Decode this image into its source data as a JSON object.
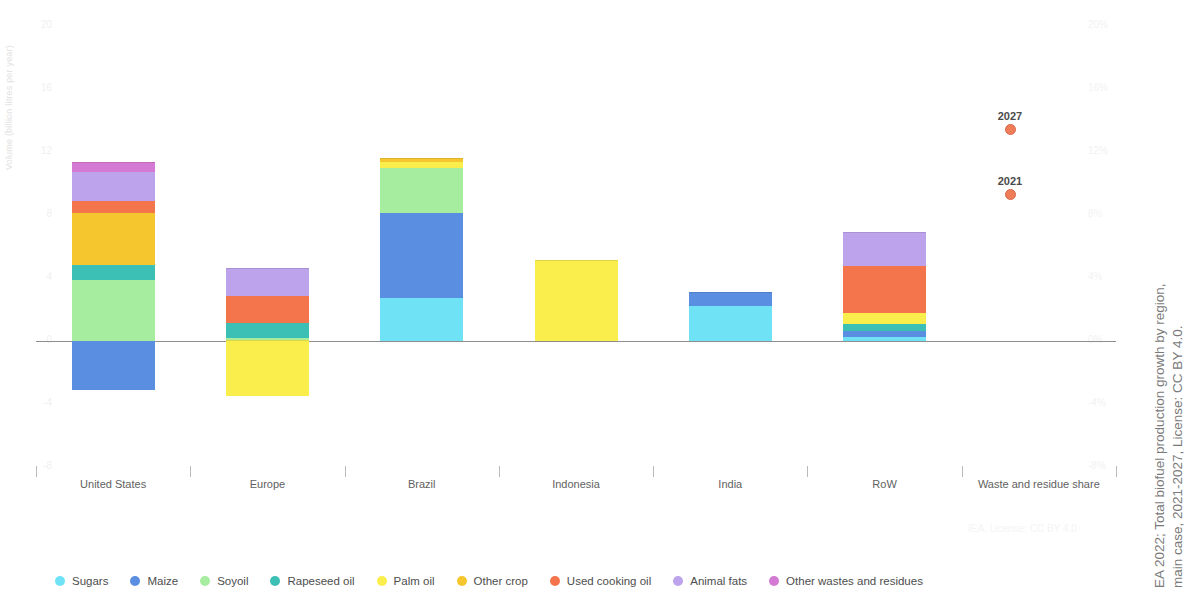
{
  "chart_data": {
    "type": "bar",
    "subtitle": "",
    "stacked": true,
    "categories": [
      "United States",
      "Europe",
      "Brazil",
      "Indonesia",
      "India",
      "RoW",
      "Waste and residue share"
    ],
    "ylabel": "Volume (billion litres per year)",
    "ylabel_right": "",
    "ylim": [
      -8,
      20
    ],
    "ylim_right": [
      -8,
      20
    ],
    "yticks": [
      "20",
      "16",
      "12",
      "8",
      "4",
      "0",
      "-4",
      "-8"
    ],
    "yticks_right": [
      "20%",
      "16%",
      "12%",
      "8%",
      "4%",
      "0%",
      "-4%",
      "-8%"
    ],
    "grid": false,
    "legend_position": "bottom",
    "series": [
      {
        "name": "Sugars",
        "color": "#6fe3f5",
        "values": [
          0,
          0,
          2.7,
          0,
          2.2,
          0.25,
          null
        ]
      },
      {
        "name": "Maize",
        "color": "#5a8ee0",
        "values": [
          -3.1,
          0,
          5.4,
          0,
          0.85,
          0.4,
          null
        ]
      },
      {
        "name": "Soyoil",
        "color": "#a6eda0",
        "values": [
          3.9,
          0.2,
          2.9,
          0,
          0,
          0,
          null
        ]
      },
      {
        "name": "Rapeseed oil",
        "color": "#3cbfb4",
        "values": [
          0.95,
          0.95,
          0,
          0,
          0,
          0.45,
          null
        ]
      },
      {
        "name": "Palm oil",
        "color": "#f9ee4c",
        "values": [
          0,
          -3.5,
          0.35,
          5.1,
          0,
          0.65,
          null
        ]
      },
      {
        "name": "Other crop",
        "color": "#f6c62e",
        "values": [
          3.3,
          0,
          0.2,
          0,
          0,
          0,
          null
        ]
      },
      {
        "name": "Used cooking oil",
        "color": "#f4744b",
        "values": [
          0.75,
          1.7,
          0,
          0,
          0,
          3.0,
          null
        ]
      },
      {
        "name": "Animal fats",
        "color": "#bda3ec",
        "values": [
          1.8,
          1.7,
          0,
          0,
          0,
          2.1,
          null
        ]
      },
      {
        "name": "Other wastes and residues",
        "color": "#d47ad4",
        "values": [
          0.6,
          0,
          0,
          0,
          0,
          0,
          null
        ]
      }
    ],
    "markers": [
      {
        "label": "2027",
        "value_pct": "12%",
        "color": "#ef7d5a"
      },
      {
        "label": "2021",
        "value_pct": "9%",
        "color": "#ef7d5a"
      }
    ]
  },
  "legend": {
    "items": [
      {
        "label": "Sugars",
        "color": "#6fe3f5"
      },
      {
        "label": "Maize",
        "color": "#5a8ee0"
      },
      {
        "label": "Soyoil",
        "color": "#a6eda0"
      },
      {
        "label": "Rapeseed oil",
        "color": "#3cbfb4"
      },
      {
        "label": "Palm oil",
        "color": "#f9ee4c"
      },
      {
        "label": "Other crop",
        "color": "#f6c62e"
      },
      {
        "label": "Used cooking oil",
        "color": "#f4744b"
      },
      {
        "label": "Animal fats",
        "color": "#bda3ec"
      },
      {
        "label": "Other wastes and residues",
        "color": "#d47ad4"
      }
    ]
  },
  "captions": {
    "watermark": "IEA. License: CC BY 4.0",
    "side_line1": "EA 2022; Total biofuel production growth by region,",
    "side_line2": "main case, 2021-2027, License: CC BY 4.0."
  }
}
